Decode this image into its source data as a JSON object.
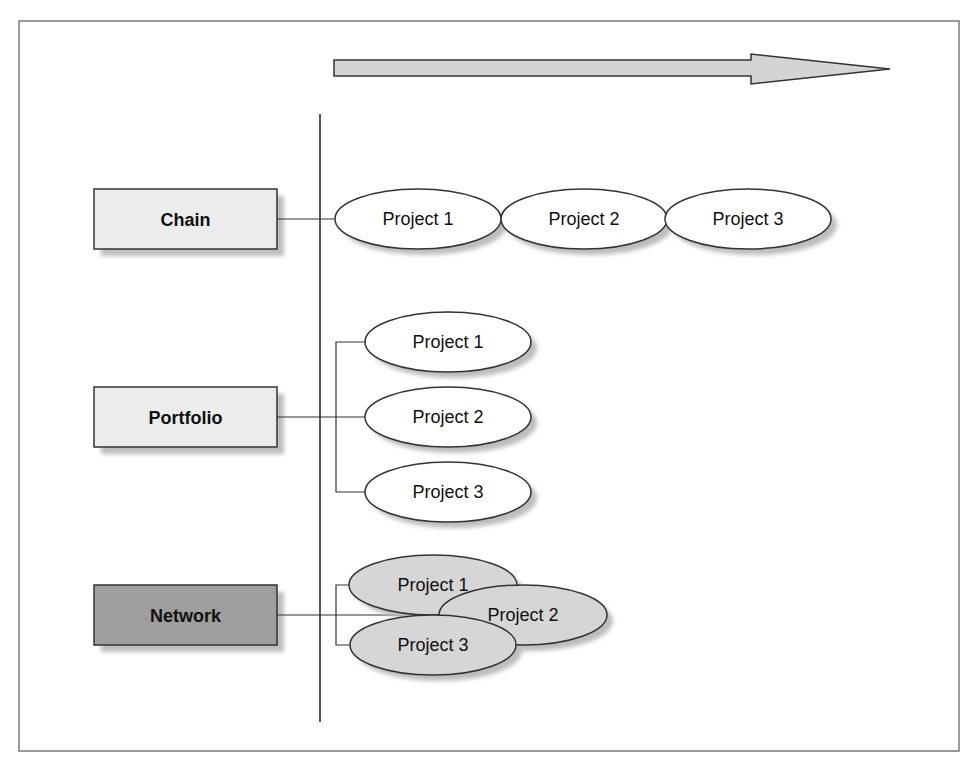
{
  "diagram": {
    "timeline_arrow": {
      "direction": "right",
      "fill": "#d4d4d4",
      "stroke": "#333333"
    },
    "rows": [
      {
        "type": "Chain",
        "box_fill": "#ececec",
        "projects": [
          "Project 1",
          "Project 2",
          "Project 3"
        ],
        "project_fill": "#ffffff"
      },
      {
        "type": "Portfolio",
        "box_fill": "#ececec",
        "projects": [
          "Project 1",
          "Project 2",
          "Project 3"
        ],
        "project_fill": "#ffffff"
      },
      {
        "type": "Network",
        "box_fill": "#9e9e9e",
        "projects": [
          "Project 1",
          "Project 2",
          "Project 3"
        ],
        "project_fill": "#d6d6d6"
      }
    ]
  }
}
